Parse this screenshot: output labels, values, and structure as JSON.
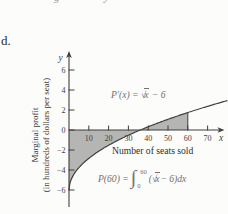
{
  "page": {
    "item_label": "d.",
    "top_fragment_left": "g",
    "top_fragment_right": "y"
  },
  "chart_data": {
    "type": "line",
    "function_label": "P′(x) = √x − 6",
    "integral_label": "P(60) = ∫₀⁶⁰ (√x − 6) dx",
    "xlabel": "Number of seats sold",
    "ylabel_line1": "Marginal profit",
    "ylabel_line2": "(in hundreds of dollars per seat)",
    "x_axis_letter": "x",
    "y_axis_letter": "y",
    "x_ticks": [
      10,
      20,
      30,
      40,
      50,
      60,
      70
    ],
    "y_ticks": [
      6,
      4,
      2,
      0,
      -2,
      -4,
      -6
    ],
    "xlim": [
      0,
      80
    ],
    "ylim": [
      -8,
      7.5
    ],
    "grid": false,
    "shaded_interval": [
      0,
      60
    ],
    "zero_crossing": 36,
    "curve_samples": [
      [
        0,
        -6
      ],
      [
        4,
        -4
      ],
      [
        9,
        -3
      ],
      [
        16,
        -2
      ],
      [
        25,
        -1
      ],
      [
        36,
        0
      ],
      [
        49,
        1
      ],
      [
        60,
        1.75
      ],
      [
        64,
        2
      ],
      [
        70,
        2.37
      ],
      [
        80,
        2.94
      ]
    ],
    "annotations": {
      "curve_formula": {
        "prefix": "P′(x) = ",
        "radical": "√",
        "radicand": "x",
        "suffix": " − 6"
      },
      "integral_formula": {
        "prefix": "P(60) = ",
        "integral": "∫",
        "upper_limit": "60",
        "lower_limit": "0",
        "body_open": "(",
        "radical": "√",
        "radicand": "x",
        "body_mid": " − 6",
        "body_close": ") ",
        "differential": "dx"
      }
    },
    "colors": {
      "shade": "#b5b5b3",
      "axis": "#3e3e3e",
      "curve": "#3e3e3e",
      "formula_text": "#717171",
      "tick_text": "#3e3e3e",
      "label_text": "#2e2e2e"
    }
  }
}
